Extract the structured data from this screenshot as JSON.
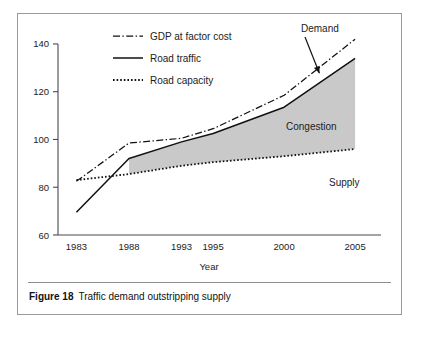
{
  "figure": {
    "caption_number": "Figure 18",
    "caption_text": "Traffic demand outstripping supply"
  },
  "chart_data": {
    "type": "line",
    "title": "",
    "subtitle": "",
    "xlabel": "Year",
    "ylabel": "",
    "categories": [
      "1983",
      "1988",
      "1993",
      "1995",
      "2000",
      "2005"
    ],
    "x_positions": [
      0,
      1,
      2,
      2.6,
      3.95,
      5.3
    ],
    "xlim": [
      -0.35,
      5.45
    ],
    "ylim": [
      60,
      145
    ],
    "yticks": [
      60,
      80,
      100,
      120,
      140
    ],
    "ytick_labels": [
      "60",
      "80",
      "100",
      "120",
      "140"
    ],
    "grid": false,
    "legend_position": "top-left-inside",
    "series": [
      {
        "name": "GDP at factor cost",
        "style": "dash-dot",
        "values": [
          82.5,
          98.5,
          100.5,
          104.5,
          118.5,
          142.0
        ]
      },
      {
        "name": "Road traffic",
        "style": "solid",
        "values": [
          69.5,
          92.0,
          99.0,
          102.5,
          113.5,
          134.0
        ]
      },
      {
        "name": "Road capacity",
        "style": "dotted",
        "values": [
          83.0,
          85.5,
          89.0,
          90.5,
          93.0,
          96.0
        ]
      }
    ],
    "shaded_region": {
      "label": "Congestion",
      "color": "#c9c9c9",
      "between": [
        "Road traffic",
        "Road capacity"
      ],
      "from_category": "1988",
      "to_category": "2005"
    },
    "annotations": [
      {
        "label": "Demand",
        "points_to": "Road traffic",
        "has_arrow": true
      },
      {
        "label": "Supply",
        "points_to": "Road capacity",
        "has_arrow": false
      },
      {
        "label": "Congestion",
        "points_to": "shaded_region",
        "has_arrow": false
      }
    ]
  },
  "legend": {
    "items": [
      {
        "label": "GDP at factor cost",
        "style": "dash-dot"
      },
      {
        "label": "Road traffic",
        "style": "solid"
      },
      {
        "label": "Road capacity",
        "style": "dotted"
      }
    ]
  },
  "colors": {
    "ink": "#111111",
    "axis": "#4a4a4a",
    "shading": "#c9c9c9",
    "frame": "#9a9a9a",
    "background": "#ffffff"
  }
}
